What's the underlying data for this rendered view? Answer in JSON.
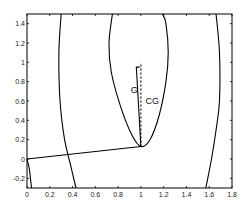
{
  "chart_data": {
    "type": "line",
    "title": "",
    "xlabel": "",
    "ylabel": "",
    "xlim": [
      0,
      1.8
    ],
    "ylim": [
      -0.3,
      1.5
    ],
    "grid": false,
    "xticks": [
      "0",
      "0.2",
      "0.4",
      "0.6",
      "0.8",
      "1",
      "1.2",
      "1.4",
      "1.6",
      "1.8"
    ],
    "yticks": [
      "-0.2",
      "0",
      "0.2",
      "0.4",
      "0.6",
      "0.8",
      "1",
      "1.2",
      "1.4"
    ],
    "series": [
      {
        "name": "left-curve",
        "x": [
          0.04,
          0.03,
          0.02,
          0.0
        ],
        "y": [
          -0.3,
          -0.2,
          -0.1,
          0.0
        ]
      },
      {
        "name": "outer-left-contour",
        "x": [
          0.3,
          0.28,
          0.29,
          0.33,
          0.38,
          0.43
        ],
        "y": [
          1.5,
          1.1,
          0.6,
          0.2,
          -0.05,
          -0.3
        ]
      },
      {
        "name": "outer-right-contour",
        "x": [
          1.66,
          1.69,
          1.69,
          1.66,
          1.62,
          1.57
        ],
        "y": [
          1.5,
          1.1,
          0.6,
          0.3,
          0.0,
          -0.3
        ]
      },
      {
        "name": "inner-contour",
        "x": [
          0.75,
          0.72,
          0.74,
          0.82,
          0.92,
          1.0,
          1.08,
          1.16,
          1.22,
          1.24,
          1.22,
          1.19
        ],
        "y": [
          1.5,
          1.2,
          0.9,
          0.55,
          0.25,
          0.13,
          0.2,
          0.45,
          0.8,
          1.1,
          1.4,
          1.5
        ]
      },
      {
        "name": "trajectory",
        "x": [
          0.0,
          1.0
        ],
        "y": [
          0.0,
          0.13
        ]
      },
      {
        "name": "G",
        "x": [
          1.0,
          0.96,
          0.96,
          0.99
        ],
        "y": [
          0.13,
          0.95,
          0.95,
          0.95
        ]
      },
      {
        "name": "CG",
        "x": [
          1.0,
          1.0
        ],
        "y": [
          0.13,
          1.0
        ],
        "style": "dashed"
      }
    ],
    "annotations": [
      {
        "text": "G",
        "x": 0.91,
        "y": 0.68
      },
      {
        "text": "CG",
        "x": 1.04,
        "y": 0.57
      }
    ]
  }
}
